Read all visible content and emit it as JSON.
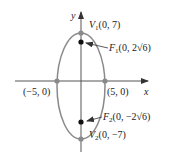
{
  "diagram": {
    "type": "ellipse-graph",
    "axes": {
      "x_label": "x",
      "y_label": "y"
    },
    "ellipse": {
      "center": [
        0,
        0
      ],
      "a": 7,
      "b": 5,
      "major_axis": "vertical",
      "color": "#8a8a8a"
    },
    "points": {
      "v1": {
        "name": "V",
        "sub": "1",
        "coords": "(0, 7)"
      },
      "v2": {
        "name": "V",
        "sub": "2",
        "coords": "(0, −7)"
      },
      "f1": {
        "name": "F",
        "sub": "1",
        "coords": "(0, 2√6)"
      },
      "f2": {
        "name": "F",
        "sub": "2",
        "coords": "(0, −2√6)"
      },
      "left": {
        "coords": "(−5, 0)"
      },
      "right": {
        "coords": "(5, 0)"
      }
    },
    "colors": {
      "axis": "#444444",
      "ellipse": "#8a8a8a",
      "vertex_dot": "#8a8a8a",
      "focus_dot": "#111111"
    }
  }
}
